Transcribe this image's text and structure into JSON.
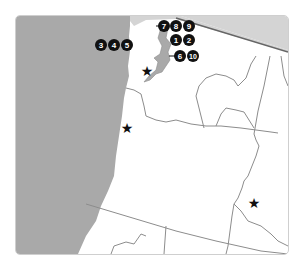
{
  "map": {
    "title": "Pacific Northwest region map",
    "colors": {
      "ocean": "#a9a9a9",
      "canada": "#d4d4d4",
      "land": "#ffffff",
      "border": "#8c8c8c",
      "marker_fill": "#111111",
      "marker_text": "#ffffff",
      "star": "#111111"
    },
    "markers": [
      {
        "label": "7",
        "group": "top"
      },
      {
        "label": "8",
        "group": "top"
      },
      {
        "label": "9",
        "group": "top"
      },
      {
        "label": "1",
        "group": "middle"
      },
      {
        "label": "2",
        "group": "middle"
      },
      {
        "label": "6",
        "group": "lower"
      },
      {
        "label": "10",
        "group": "lower"
      },
      {
        "label": "3",
        "group": "coast"
      },
      {
        "label": "4",
        "group": "coast"
      },
      {
        "label": "5",
        "group": "coast"
      }
    ],
    "stars": [
      {
        "name": "Seattle area"
      },
      {
        "name": "Portland area"
      },
      {
        "name": "Boise area"
      }
    ]
  }
}
